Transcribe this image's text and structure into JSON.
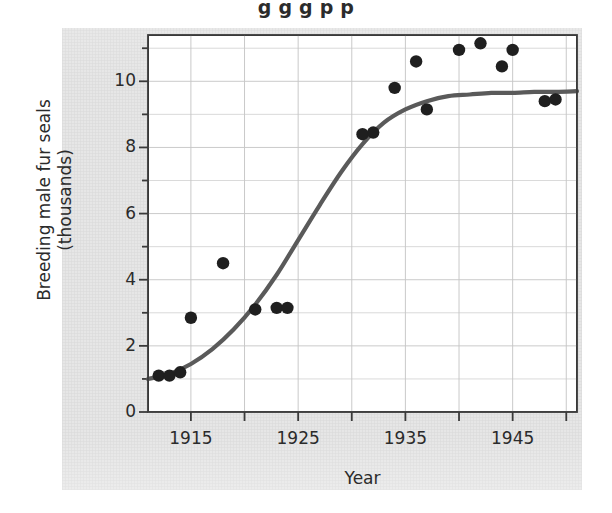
{
  "figure": {
    "partial_title_top": "g   g  g               p p",
    "background_color": "#e6e6e6",
    "plot_background_color": "#ffffff",
    "axis_color": "#3a3a3a",
    "grid_color": "#c8c8c8",
    "curve_color": "#5a5a5a",
    "point_color": "#1f1f1f"
  },
  "chart_data": {
    "type": "scatter",
    "title": "",
    "xlabel": "Year",
    "ylabel": "Breeding male fur seals (thousands)",
    "ylabel_line1": "Breeding male fur seals",
    "ylabel_line2": "(thousands)",
    "xlim": [
      1911,
      1951
    ],
    "ylim": [
      0,
      11.4
    ],
    "xticks": [
      1915,
      1925,
      1935,
      1945
    ],
    "xtick_labels": [
      "1915",
      "1925",
      "1935",
      "1945"
    ],
    "xminor_step": 5,
    "yticks": [
      0,
      2,
      4,
      6,
      8,
      10
    ],
    "ytick_labels": [
      "0",
      "2",
      "4",
      "6",
      "8",
      "10"
    ],
    "yminor_step": 1,
    "grid": true,
    "legend": null,
    "series": [
      {
        "name": "Observed breeding male fur seals",
        "type": "scatter",
        "marker": "circle",
        "color": "#1f1f1f",
        "points": [
          {
            "x": 1912,
            "y": 1.1
          },
          {
            "x": 1913,
            "y": 1.1
          },
          {
            "x": 1914,
            "y": 1.2
          },
          {
            "x": 1915,
            "y": 2.85
          },
          {
            "x": 1918,
            "y": 4.5
          },
          {
            "x": 1921,
            "y": 3.1
          },
          {
            "x": 1923,
            "y": 3.15
          },
          {
            "x": 1924,
            "y": 3.15
          },
          {
            "x": 1931,
            "y": 8.4
          },
          {
            "x": 1932,
            "y": 8.45
          },
          {
            "x": 1934,
            "y": 9.8
          },
          {
            "x": 1936,
            "y": 10.6
          },
          {
            "x": 1937,
            "y": 9.15
          },
          {
            "x": 1940,
            "y": 10.95
          },
          {
            "x": 1942,
            "y": 11.15
          },
          {
            "x": 1944,
            "y": 10.45
          },
          {
            "x": 1945,
            "y": 10.95
          },
          {
            "x": 1948,
            "y": 9.4
          },
          {
            "x": 1949,
            "y": 9.45
          }
        ]
      },
      {
        "name": "Fitted logistic growth curve",
        "type": "line",
        "color": "#5a5a5a",
        "points": [
          {
            "x": 1911,
            "y": 1.0
          },
          {
            "x": 1913,
            "y": 1.15
          },
          {
            "x": 1915,
            "y": 1.45
          },
          {
            "x": 1917,
            "y": 1.9
          },
          {
            "x": 1919,
            "y": 2.5
          },
          {
            "x": 1921,
            "y": 3.25
          },
          {
            "x": 1923,
            "y": 4.15
          },
          {
            "x": 1925,
            "y": 5.2
          },
          {
            "x": 1927,
            "y": 6.25
          },
          {
            "x": 1929,
            "y": 7.25
          },
          {
            "x": 1931,
            "y": 8.1
          },
          {
            "x": 1933,
            "y": 8.75
          },
          {
            "x": 1935,
            "y": 9.15
          },
          {
            "x": 1937,
            "y": 9.4
          },
          {
            "x": 1939,
            "y": 9.55
          },
          {
            "x": 1941,
            "y": 9.6
          },
          {
            "x": 1943,
            "y": 9.65
          },
          {
            "x": 1945,
            "y": 9.65
          },
          {
            "x": 1947,
            "y": 9.68
          },
          {
            "x": 1949,
            "y": 9.68
          },
          {
            "x": 1951,
            "y": 9.7
          }
        ]
      }
    ]
  }
}
